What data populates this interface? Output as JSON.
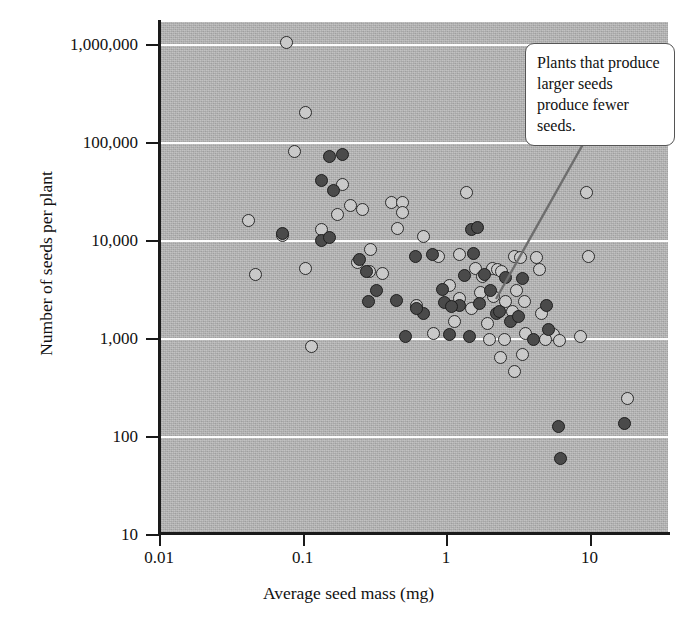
{
  "chart_data": {
    "type": "scatter",
    "title": "",
    "xlabel": "Average seed mass (mg)",
    "ylabel": "Number of seeds per plant",
    "xscale": "log",
    "yscale": "log",
    "xlim": [
      0.01,
      30
    ],
    "ylim": [
      10,
      3000000
    ],
    "xticks": [
      "0.01",
      "0.1",
      "1",
      "10"
    ],
    "xtick_values": [
      0.01,
      0.1,
      1,
      10
    ],
    "yticks": [
      "1,000,000",
      "100,000",
      "10,000",
      "1,000",
      "100",
      "10"
    ],
    "ytick_values": [
      1000000,
      100000,
      10000,
      1000,
      100,
      10
    ],
    "grid": "horizontal gridlines at each labeled decade",
    "legend": "none",
    "annotations": [
      {
        "text": "Plants that produce larger seeds produce fewer seeds.",
        "box": true,
        "leader_line": true,
        "points_to": [
          4.0,
          1800
        ]
      }
    ],
    "series": [
      {
        "name": "light-marker species",
        "marker": "light gray filled circle",
        "points": [
          [
            0.077,
            1050000
          ],
          [
            0.105,
            205000
          ],
          [
            0.088,
            82000
          ],
          [
            0.19,
            38000
          ],
          [
            0.042,
            16000
          ],
          [
            0.072,
            11500
          ],
          [
            0.215,
            23000
          ],
          [
            0.26,
            21000
          ],
          [
            0.175,
            18500
          ],
          [
            0.047,
            4600
          ],
          [
            0.105,
            5200
          ],
          [
            0.24,
            6100
          ],
          [
            0.295,
            4900
          ],
          [
            0.42,
            25000
          ],
          [
            0.5,
            24500
          ],
          [
            0.5,
            19500
          ],
          [
            0.135,
            13000
          ],
          [
            0.46,
            13500
          ],
          [
            0.3,
            8200
          ],
          [
            0.36,
            4700
          ],
          [
            0.115,
            830
          ],
          [
            0.7,
            11000
          ],
          [
            0.88,
            6900
          ],
          [
            1.05,
            3500
          ],
          [
            1.25,
            7200
          ],
          [
            1.4,
            31000
          ],
          [
            1.25,
            2600
          ],
          [
            1.6,
            5200
          ],
          [
            1.8,
            4300
          ],
          [
            1.75,
            3000
          ],
          [
            2.1,
            5300
          ],
          [
            2.3,
            5100
          ],
          [
            2.45,
            4900
          ],
          [
            2.15,
            2700
          ],
          [
            1.95,
            1450
          ],
          [
            2.6,
            2400
          ],
          [
            3.0,
            7000
          ],
          [
            3.3,
            6800
          ],
          [
            3.1,
            3100
          ],
          [
            2.9,
            1900
          ],
          [
            3.5,
            2400
          ],
          [
            3.6,
            1150
          ],
          [
            3.4,
            690
          ],
          [
            2.55,
            1000
          ],
          [
            4.3,
            6800
          ],
          [
            4.5,
            5100
          ],
          [
            4.6,
            1800
          ],
          [
            5.6,
            1100
          ],
          [
            6.2,
            960
          ],
          [
            4.9,
            1000
          ],
          [
            9.5,
            31000
          ],
          [
            9.8,
            7000
          ],
          [
            8.6,
            1050
          ],
          [
            18.5,
            245
          ],
          [
            1.15,
            1500
          ],
          [
            1.5,
            2050
          ],
          [
            0.62,
            2200
          ],
          [
            0.82,
            1150
          ],
          [
            2.0,
            980
          ],
          [
            2.4,
            640
          ],
          [
            3.0,
            470
          ]
        ]
      },
      {
        "name": "dark-marker species",
        "marker": "dark gray filled circle",
        "points": [
          [
            0.155,
            72000
          ],
          [
            0.19,
            77000
          ],
          [
            0.135,
            41000
          ],
          [
            0.165,
            33000
          ],
          [
            0.072,
            11800
          ],
          [
            0.135,
            10200
          ],
          [
            0.155,
            10800
          ],
          [
            0.25,
            6400
          ],
          [
            0.28,
            4900
          ],
          [
            0.33,
            3100
          ],
          [
            0.29,
            2400
          ],
          [
            0.45,
            2500
          ],
          [
            0.61,
            7000
          ],
          [
            0.8,
            7200
          ],
          [
            0.95,
            3200
          ],
          [
            0.98,
            2350
          ],
          [
            1.25,
            2200
          ],
          [
            1.1,
            2150
          ],
          [
            1.5,
            13200
          ],
          [
            1.65,
            13800
          ],
          [
            1.55,
            7500
          ],
          [
            1.35,
            4400
          ],
          [
            1.85,
            4600
          ],
          [
            2.05,
            3100
          ],
          [
            1.7,
            2300
          ],
          [
            2.25,
            1800
          ],
          [
            2.6,
            4200
          ],
          [
            2.8,
            1500
          ],
          [
            3.4,
            4100
          ],
          [
            3.2,
            1700
          ],
          [
            0.7,
            1800
          ],
          [
            0.52,
            1050
          ],
          [
            1.05,
            1100
          ],
          [
            5.0,
            2200
          ],
          [
            5.2,
            1250
          ],
          [
            6.1,
            128
          ],
          [
            6.3,
            60
          ],
          [
            17.5,
            138
          ],
          [
            4.1,
            990
          ],
          [
            0.62,
            2050
          ],
          [
            2.35,
            1900
          ],
          [
            1.45,
            1050
          ]
        ]
      }
    ]
  },
  "axes": {
    "y_label": "Number of seeds per plant",
    "x_label": "Average seed mass (mg)",
    "y_tick_labels": [
      "1,000,000",
      "100,000",
      "10,000",
      "1,000",
      "100",
      "10"
    ],
    "x_tick_labels": [
      "0.01",
      "0.1",
      "1",
      "10"
    ]
  },
  "callout": {
    "text": "Plants that produce larger seeds produce fewer seeds."
  },
  "colors": {
    "plot_background": "#b9b9b9",
    "gridline": "#fdfdfd",
    "axis": "#1a1a1a",
    "marker_light": "#c9c9c9",
    "marker_dark": "#4a4a4a",
    "callout_background": "#ffffff",
    "callout_border": "#555555"
  }
}
